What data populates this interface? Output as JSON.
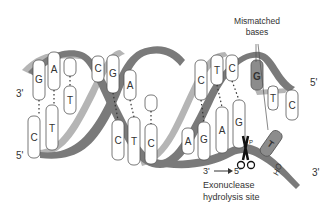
{
  "diagram": {
    "colors": {
      "backbone_dark": "#7a7a7a",
      "backbone_light": "#b5b5b5",
      "base_fill": "#ffffff",
      "base_mismatch": "#8c8c8c",
      "outline": "#555555",
      "text": "#333333"
    },
    "strand_ends": {
      "left_top": "3'",
      "left_bottom": "5'",
      "right_top": "5'",
      "right_bottom": "3'"
    },
    "top_strand_bases": [
      "G",
      "A",
      "",
      "C",
      "G",
      "A",
      "",
      "C",
      "T",
      "C",
      "G",
      "T",
      "C"
    ],
    "bottom_strand_bases": [
      "C",
      "T",
      "T",
      "",
      "C",
      "T",
      "C",
      "A",
      "T",
      "G",
      "A",
      "G",
      "T"
    ],
    "labels": {
      "mismatch_line1": "Mismatched",
      "mismatch_line2": "bases",
      "direction_from": "3'",
      "direction_to": "5'",
      "site_line1": "Exonuclease",
      "site_line2": "hydrolysis site",
      "hydroxyl": "HO",
      "mismatch_top_base": "G",
      "mismatch_bottom_base": "T",
      "phosphate": "P"
    },
    "icons": {
      "scissors": "scissors-icon",
      "arrow": "arrow-right-icon"
    }
  }
}
